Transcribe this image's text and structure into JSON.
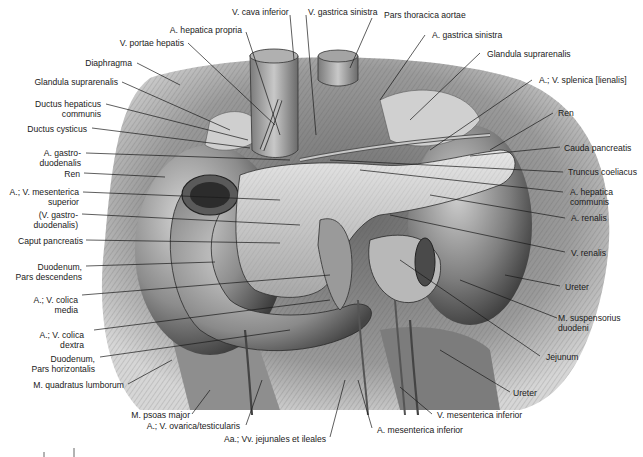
{
  "figure": {
    "colors": {
      "background": "#ffffff",
      "ink": "#1a1a1a",
      "tissue_dark": "#3a3a3a",
      "tissue_mid": "#8a8a8a",
      "tissue_light": "#d8d8d8"
    }
  },
  "labels": {
    "top": [
      {
        "id": "v-cava-inferior",
        "lines": [
          "V. cava inferior"
        ]
      },
      {
        "id": "v-gastrica-sinistra",
        "lines": [
          "V. gastrica sinistra"
        ]
      },
      {
        "id": "pars-thoracica-aortae",
        "lines": [
          "Pars thoracica aortae"
        ]
      },
      {
        "id": "a-hepatica-propria",
        "lines": [
          "A. hepatica propria"
        ]
      },
      {
        "id": "a-gastrica-sinistra",
        "lines": [
          "A. gastrica sinistra"
        ]
      }
    ],
    "left": [
      {
        "id": "v-portae-hepatis",
        "lines": [
          "V. portae hepatis"
        ]
      },
      {
        "id": "diaphragma",
        "lines": [
          "Diaphragma"
        ]
      },
      {
        "id": "glandula-suprarenalis-left",
        "lines": [
          "Glandula suprarenalis"
        ]
      },
      {
        "id": "ductus-hepaticus-communis",
        "lines": [
          "Ductus hepaticus",
          "communis"
        ]
      },
      {
        "id": "ductus-cysticus",
        "lines": [
          "Ductus cysticus"
        ]
      },
      {
        "id": "a-gastroduodenalis",
        "lines": [
          "A. gastro-",
          "duodenalis"
        ]
      },
      {
        "id": "ren-left",
        "lines": [
          "Ren"
        ]
      },
      {
        "id": "av-mesenterica-superior",
        "lines": [
          "A.; V. mesenterica",
          "superior"
        ]
      },
      {
        "id": "v-gastroduodenalis",
        "lines": [
          "(V. gastro-",
          "duodenalis)"
        ]
      },
      {
        "id": "caput-pancreatis",
        "lines": [
          "Caput pancreatis"
        ]
      },
      {
        "id": "duodenum-pars-descendens",
        "lines": [
          "Duodenum,",
          "Pars descendens"
        ]
      },
      {
        "id": "av-colica-media",
        "lines": [
          "A.; V. colica",
          "media"
        ]
      },
      {
        "id": "av-colica-dextra",
        "lines": [
          "A.; V. colica",
          "dextra"
        ]
      },
      {
        "id": "duodenum-pars-horizontalis",
        "lines": [
          "Duodenum,",
          "Pars horizontalis"
        ]
      },
      {
        "id": "m-quadratus-lumborum",
        "lines": [
          "M. quadratus lumborum"
        ]
      }
    ],
    "right": [
      {
        "id": "glandula-suprarenalis-right",
        "lines": [
          "Glandula suprarenalis"
        ]
      },
      {
        "id": "av-splenica",
        "lines": [
          "A.; V. splenica [lienalis]"
        ]
      },
      {
        "id": "ren-right",
        "lines": [
          "Ren"
        ]
      },
      {
        "id": "cauda-pancreatis",
        "lines": [
          "Cauda pancreatis"
        ]
      },
      {
        "id": "truncus-coeliacus",
        "lines": [
          "Truncus coeliacus"
        ]
      },
      {
        "id": "a-hepatica-communis",
        "lines": [
          "A. hepatica",
          "communis"
        ]
      },
      {
        "id": "a-renalis",
        "lines": [
          "A. renalis"
        ]
      },
      {
        "id": "v-renalis",
        "lines": [
          "V. renalis"
        ]
      },
      {
        "id": "ureter-upper",
        "lines": [
          "Ureter"
        ]
      },
      {
        "id": "m-suspensorius-duodeni",
        "lines": [
          "M. suspensorius",
          "duodeni"
        ]
      },
      {
        "id": "jejunum",
        "lines": [
          "Jejunum"
        ]
      },
      {
        "id": "ureter-lower",
        "lines": [
          "Ureter"
        ]
      }
    ],
    "bottom": [
      {
        "id": "m-psoas-major",
        "lines": [
          "M. psoas major"
        ]
      },
      {
        "id": "av-ovarica-testicularis",
        "lines": [
          "A.; V. ovarica/testicularis"
        ]
      },
      {
        "id": "aa-vv-jejunales-ileales",
        "lines": [
          "Aa.; Vv. jejunales et ileales"
        ]
      },
      {
        "id": "a-mesenterica-inferior",
        "lines": [
          "A. mesenterica inferior"
        ]
      },
      {
        "id": "v-mesenterica-inferior",
        "lines": [
          "V. mesenterica inferior"
        ]
      }
    ]
  }
}
